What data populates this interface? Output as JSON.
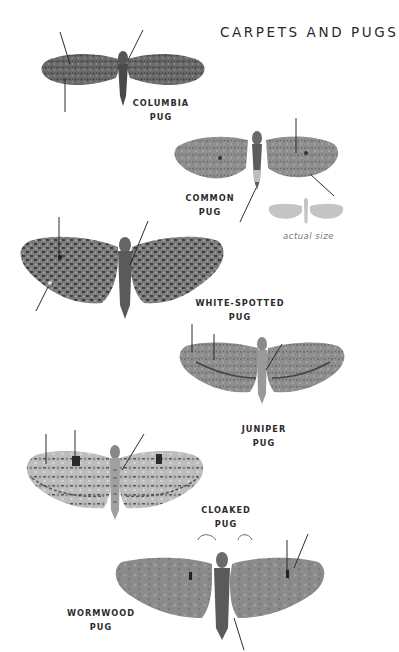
{
  "page": {
    "title": "CARPETS AND PUGS"
  },
  "species": [
    {
      "name": "COLUMBIA",
      "suffix": "PUG"
    },
    {
      "name": "COMMON",
      "suffix": "PUG"
    },
    {
      "name": "WHITE-SPOTTED",
      "suffix": "PUG"
    },
    {
      "name": "JUNIPER",
      "suffix": "PUG"
    },
    {
      "name": "CLOAKED",
      "suffix": "PUG"
    },
    {
      "name": "WORMWOOD",
      "suffix": "PUG"
    }
  ],
  "actual_size": {
    "caption": "actual size",
    "silhouette_color": "#c4c4c4"
  },
  "colors": {
    "text": "#2c2c2c",
    "pointer_line": "#2b2b2b",
    "moth_dark": "#5a5a5a",
    "moth_mid": "#8a8a8a",
    "moth_light": "#b8b8b8"
  }
}
